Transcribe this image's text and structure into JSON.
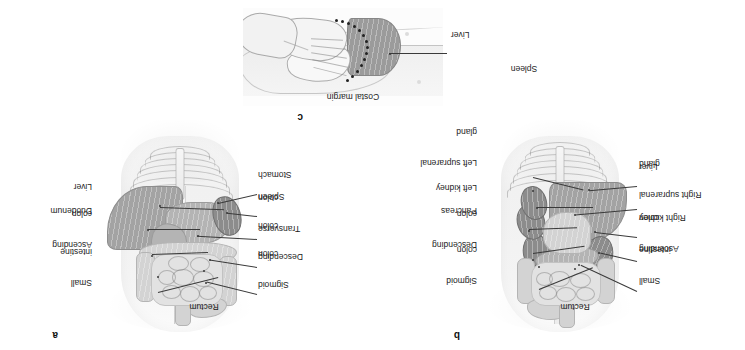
{
  "figure": {
    "orientation_note": "figure-rotated-180",
    "panels": [
      {
        "id": "a",
        "letter": "a",
        "caption": "Anterior view of abdominal viscera",
        "labels_left": [
          {
            "text": "Sigmoid\ncolon",
            "lines": [
              "Sigmoid",
              "colon"
            ]
          },
          {
            "text": "Descending\ncolon",
            "lines": [
              "Descending",
              "colon"
            ]
          },
          {
            "text": "Transverse\ncolon",
            "lines": [
              "Transverse",
              "colon"
            ]
          },
          {
            "text": "Spleen",
            "lines": [
              "Spleen"
            ]
          },
          {
            "text": "Stomach",
            "lines": [
              "Stomach"
            ]
          }
        ],
        "labels_right": [
          {
            "text": "Small\nintestine",
            "lines": [
              "Small",
              "intestine"
            ]
          },
          {
            "text": "Ascending\ncolon",
            "lines": [
              "Ascending",
              "colon"
            ]
          },
          {
            "text": "Duodenum",
            "lines": [
              "Duodenum"
            ]
          },
          {
            "text": "Liver",
            "lines": [
              "Liver"
            ]
          }
        ],
        "label_top": {
          "text": "Rectum",
          "lines": [
            "Rectum"
          ]
        }
      },
      {
        "id": "b",
        "letter": "b",
        "caption": "Deeper dissection showing retroperitoneal structures",
        "labels_left": [
          {
            "text": "Small\nintestine",
            "lines": [
              "Small",
              "intestine"
            ]
          },
          {
            "text": "Ascending\ncolon",
            "lines": [
              "Ascending",
              "colon"
            ]
          },
          {
            "text": "Right kidney",
            "lines": [
              "Right kidney"
            ]
          },
          {
            "text": "Right suprarenal\ngland",
            "lines": [
              "Right suprarenal",
              "gland"
            ]
          },
          {
            "text": "Liver",
            "lines": [
              "Liver"
            ]
          }
        ],
        "labels_right": [
          {
            "text": "Sigmoid\ncolon",
            "lines": [
              "Sigmoid",
              "colon"
            ]
          },
          {
            "text": "Descending\ncolon",
            "lines": [
              "Descending",
              "colon"
            ]
          },
          {
            "text": "Pancreas",
            "lines": [
              "Pancreas"
            ]
          },
          {
            "text": "Left kidney",
            "lines": [
              "Left kidney"
            ]
          },
          {
            "text": "Left suprarenal\ngland",
            "lines": [
              "Left suprarenal",
              "gland"
            ]
          }
        ],
        "label_top": {
          "text": "Rectum",
          "lines": [
            "Rectum"
          ]
        },
        "label_bottom": {
          "text": "Spleen",
          "lines": [
            "Spleen"
          ]
        }
      },
      {
        "id": "c",
        "letter": "c",
        "caption": "Palpation of the liver below the costal margin",
        "labels": [
          {
            "text": "Costal margin",
            "lines": [
              "Costal margin"
            ]
          },
          {
            "text": "Liver",
            "lines": [
              "Liver"
            ]
          }
        ]
      }
    ]
  },
  "colors": {
    "background": "#ffffff",
    "text": "#1c1c1c",
    "leader_line": "#3a3a3a",
    "organ_liver": "#a3a3a3",
    "organ_mid": "#b4b4b4",
    "organ_dark": "#8c8c8c",
    "organ_light": "#d3d3d3",
    "organ_pale": "#e2e2e2",
    "body_outline": "#f2f2f2"
  }
}
